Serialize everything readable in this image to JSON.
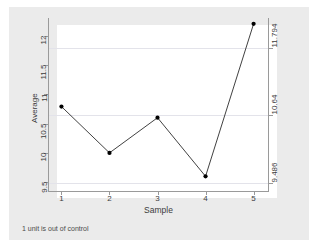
{
  "chart_data": {
    "type": "line",
    "title": "",
    "subtitle": "",
    "xlabel": "Sample",
    "ylabel": "Average",
    "x": [
      1,
      2,
      3,
      4,
      5
    ],
    "categories": [
      "1",
      "2",
      "3",
      "4",
      "5"
    ],
    "values": [
      10.79,
      10.0,
      10.6,
      9.6,
      12.2
    ],
    "series": [
      {
        "name": "Average",
        "values": [
          10.79,
          10.0,
          10.6,
          9.6,
          12.2
        ]
      }
    ],
    "xlim": [
      0.72,
      5.3
    ],
    "ylim": [
      9.35,
      12.3
    ],
    "yticks": [
      9.5,
      10,
      10.5,
      11,
      11.5,
      12
    ],
    "ytick_labels": [
      "9.5",
      "10",
      "10.5",
      "11",
      "11.5",
      "12"
    ],
    "xticks": [
      1,
      2,
      3,
      4,
      5
    ],
    "xtick_labels": [
      "1",
      "2",
      "3",
      "4",
      "5"
    ],
    "grid": false,
    "legend": "none",
    "annotations": [
      "1 unit is out of control"
    ],
    "control_limits": {
      "ucl": {
        "value": 11.794,
        "label": "11.794"
      },
      "center": {
        "value": 10.64,
        "label": "10.64"
      },
      "lcl": {
        "value": 9.486,
        "label": "9.486"
      }
    },
    "right_axis_labels": [
      "11.794",
      "10.64",
      "9.486"
    ],
    "marker": "filled-circle",
    "line_color": "#2b2b2b",
    "marker_color": "#000000",
    "limit_line_color": "#e3e3ea",
    "plot_background": "#ffffff",
    "canvas_background": "#ebebeb"
  },
  "footer": {
    "note": "1 unit is out of control"
  }
}
